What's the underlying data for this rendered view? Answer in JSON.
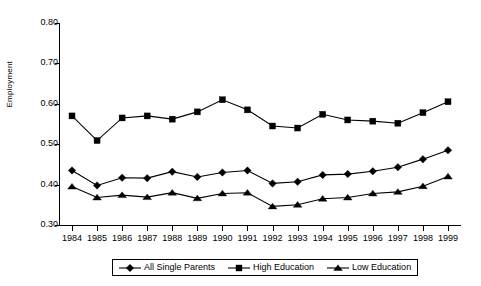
{
  "chart_data": {
    "type": "line",
    "title": "",
    "xlabel": "",
    "ylabel": "Employment",
    "categories": [
      "1984",
      "1985",
      "1986",
      "1987",
      "1988",
      "1989",
      "1990",
      "1991",
      "1992",
      "1993",
      "1994",
      "1995",
      "1996",
      "1997",
      "1998",
      "1999"
    ],
    "x": [
      1984,
      1985,
      1986,
      1987,
      1988,
      1989,
      1990,
      1991,
      1992,
      1993,
      1994,
      1995,
      1996,
      1997,
      1998,
      1999
    ],
    "ylim": [
      0.3,
      0.8
    ],
    "xlim": [
      1984,
      1999
    ],
    "ytick_labels": [
      "0.80",
      "0.70",
      "0.60",
      "0.50",
      "0.40",
      "0.30"
    ],
    "ytick_values": [
      0.8,
      0.7,
      0.6,
      0.5,
      0.4,
      0.3
    ],
    "grid": false,
    "legend_position": "bottom",
    "series": [
      {
        "name": "All Single Parents",
        "marker": "diamond",
        "color": "#000000",
        "values": [
          0.435,
          0.398,
          0.417,
          0.416,
          0.432,
          0.419,
          0.43,
          0.435,
          0.403,
          0.407,
          0.424,
          0.426,
          0.433,
          0.443,
          0.463,
          0.485
        ]
      },
      {
        "name": "High Education",
        "marker": "square",
        "color": "#000000",
        "values": [
          0.57,
          0.509,
          0.565,
          0.57,
          0.562,
          0.58,
          0.61,
          0.585,
          0.545,
          0.54,
          0.574,
          0.56,
          0.557,
          0.552,
          0.578,
          0.605
        ]
      },
      {
        "name": "Low Education",
        "marker": "triangle",
        "color": "#000000",
        "values": [
          0.395,
          0.368,
          0.374,
          0.369,
          0.38,
          0.366,
          0.378,
          0.38,
          0.346,
          0.35,
          0.365,
          0.368,
          0.378,
          0.382,
          0.396,
          0.42
        ]
      }
    ]
  },
  "legend": {
    "items": [
      {
        "label": "All Single Parents",
        "marker": "diamond"
      },
      {
        "label": "High Education",
        "marker": "square"
      },
      {
        "label": "Low Education",
        "marker": "triangle"
      }
    ]
  }
}
